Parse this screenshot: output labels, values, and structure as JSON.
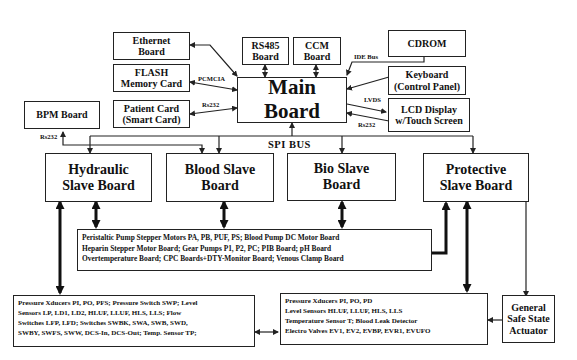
{
  "diagram": {
    "main_board": {
      "label": "Main Board"
    },
    "peripherals": {
      "ethernet": {
        "line1": "Ethernet",
        "line2": "Board"
      },
      "flash": {
        "line1": "FLASH",
        "line2": "Memory Card"
      },
      "patient_card": {
        "line1": "Patient Card",
        "line2": "(Smart Card)"
      },
      "bpm": {
        "label": "BPM Board"
      },
      "rs485": {
        "line1": "RS485",
        "line2": "Board"
      },
      "ccm": {
        "line1": "CCM",
        "line2": "Board"
      },
      "cdrom": {
        "label": "CDROM"
      },
      "keyboard": {
        "line1": "Keyboard",
        "line2": "(Control Panel)"
      },
      "lcd": {
        "line1": "LCD Display",
        "line2": "w/Touch Screen"
      }
    },
    "connection_labels": {
      "pcmcia": "PCMCIA",
      "rs232_patient": "Rs232",
      "rs232_bpm": "Rs232",
      "ide_bus": "IDE Bus",
      "lvds": "LVDS",
      "rs232_lcd": "Rs232",
      "spi_bus": "SPI  BUS"
    },
    "slave_boards": [
      {
        "line1": "Hydraulic",
        "line2": "Slave Board"
      },
      {
        "line1": "Blood Slave",
        "line2": "Board"
      },
      {
        "line1": "Bio Slave",
        "line2": "Board"
      },
      {
        "line1": "Protective",
        "line2": "Slave Board"
      }
    ],
    "actuator_board_list": [
      "Peristaltic Pump Stepper Motors PA, PB, PUF, PS; Blood Pump DC Motor Board",
      "Heparin Stepper Motor Board; Gear Pumps P1, P2, PC;  PIB Board; pH Board",
      "Overtemperature Board; CPC  Boards+DTY-Monitor Board; Venous Clamp Board"
    ],
    "hydraulic_sensor_list": [
      "Pressure Xducers PI, PO, PFS; Pressure Switch SWP; Level",
      "Sensors LP, LD1, LD2, HLUF, LLUF, HLS, LLS; Flow",
      "Switches LFP, LFD; Switches SWBK, SWA, SWB, SWD,",
      "SWBY, SWFS, SWW, DCS-In, DCS-Out; Temp. Sensor TP;"
    ],
    "protective_sensor_list": [
      "Pressure Xducers PI, PO, PD",
      "Level Sensors HLUF, LLUF, HLS, LLS",
      "Temperature Sensor T; Blood Leak Detector",
      "Electro Valves EV1, EV2, EVBP, EVR1, EVUFO"
    ],
    "safe_state_actuator": {
      "line1": "General",
      "line2": "Safe State",
      "line3": "Actuator"
    }
  }
}
